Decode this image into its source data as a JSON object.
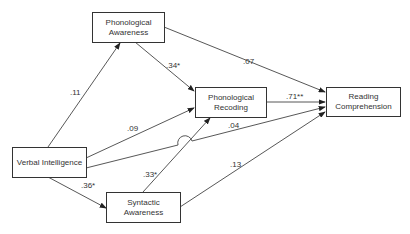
{
  "nodes": {
    "pa": {
      "line1": "Phonological",
      "line2": "Awareness"
    },
    "pr": {
      "line1": "Phonological",
      "line2": "Recoding"
    },
    "rc": {
      "line1": "Reading",
      "line2": "Comprehension"
    },
    "vi": {
      "line1": "Verbal Intelligence"
    },
    "sa": {
      "line1": "Syntactic",
      "line2": "Awareness"
    }
  },
  "edges": {
    "vi_pa": ".11",
    "pa_pr": ".34*",
    "pa_rc": ".07",
    "vi_pr": ".09",
    "pr_rc": ".71**",
    "vi_rc": ".04",
    "vi_sa": ".36*",
    "sa_pr": ".33*",
    "sa_rc": ".13"
  }
}
